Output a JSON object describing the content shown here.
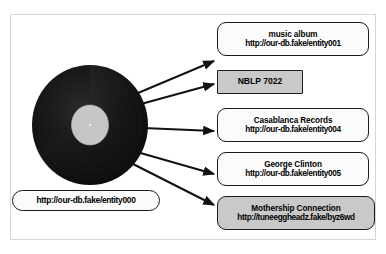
{
  "figure": {
    "name": "rdf-entity-graph",
    "subject": {
      "uri": "http://our-db.fake/entity000",
      "shape": "rounded-pill",
      "fill": "#fbfbfb"
    },
    "record_icon": {
      "name": "vinyl-record",
      "disc_color": "#161616",
      "label_color": "#c6c6c6"
    },
    "nodes": [
      {
        "id": "type",
        "title": "music album",
        "uri": "http://our-db.fake/entity001",
        "shape": "rounded",
        "fill": "#fbfbfb"
      },
      {
        "id": "catalog",
        "title": "NBLP 7022",
        "uri": "",
        "shape": "rect",
        "fill": "#c9c9c9"
      },
      {
        "id": "label",
        "title": "Casablanca Records",
        "uri": "http://our-db.fake/entity004",
        "shape": "rounded",
        "fill": "#fbfbfb"
      },
      {
        "id": "artist",
        "title": "George Clinton",
        "uri": "http://our-db.fake/entity005",
        "shape": "rounded",
        "fill": "#fbfbfb"
      },
      {
        "id": "external",
        "title": "Mothership Connection",
        "uri": "http://tuneeggheadz.fake/byz6wd",
        "shape": "rounded",
        "fill": "#c9c9c9"
      }
    ],
    "colors": {
      "frame_border": "#d6d6d6",
      "node_border": "#1a1a1a",
      "connector": "#111111",
      "background": "#ffffff"
    }
  }
}
